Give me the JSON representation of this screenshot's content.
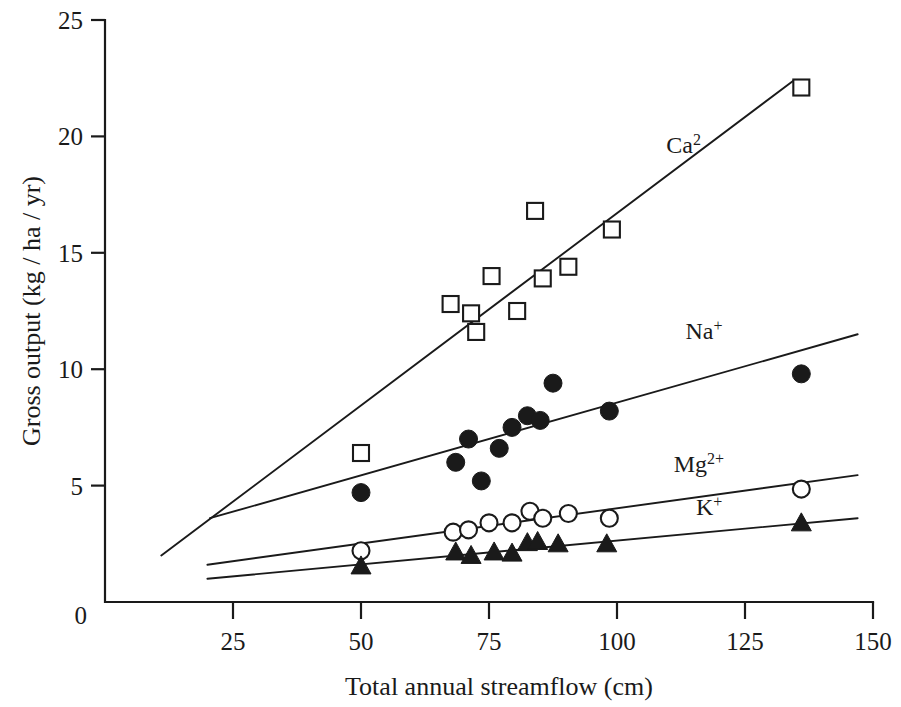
{
  "chart_data": {
    "type": "scatter",
    "title": "",
    "xlabel": "Total annual streamflow (cm)",
    "ylabel": "Gross output (kg / ha / yr)",
    "xlim": [
      0,
      150
    ],
    "ylim": [
      0,
      25
    ],
    "xticks": [
      0,
      25,
      50,
      75,
      100,
      125,
      150
    ],
    "xticklabels": [
      "0",
      "25",
      "50",
      "75",
      "100",
      "125",
      "150"
    ],
    "yticks": [
      0,
      5,
      10,
      15,
      20,
      25
    ],
    "yticklabels": [
      "0",
      "5",
      "10",
      "15",
      "20",
      "25"
    ],
    "grid": false,
    "legend_position": "inline-right-of-lines",
    "series": [
      {
        "name": "Ca2",
        "label_html": "Ca<sup>2</sup>",
        "label_text": "Ca2",
        "marker": "open-square",
        "label_x": 113,
        "label_y": 19.3,
        "points": [
          {
            "x": 50.0,
            "y": 6.4
          },
          {
            "x": 67.5,
            "y": 12.8
          },
          {
            "x": 71.5,
            "y": 12.4
          },
          {
            "x": 72.5,
            "y": 11.6
          },
          {
            "x": 75.5,
            "y": 14.0
          },
          {
            "x": 80.5,
            "y": 12.5
          },
          {
            "x": 84.0,
            "y": 16.8
          },
          {
            "x": 85.5,
            "y": 13.9
          },
          {
            "x": 90.5,
            "y": 14.4
          },
          {
            "x": 99.0,
            "y": 16.0
          },
          {
            "x": 136.0,
            "y": 22.1
          }
        ],
        "fit": {
          "x1": 11.0,
          "y1": 2.0,
          "x2": 134.5,
          "y2": 22.4
        }
      },
      {
        "name": "Na+",
        "label_html": "Na<sup>+</sup>",
        "label_text": "Na+",
        "marker": "filled-circle",
        "label_x": 117,
        "label_y": 11.3,
        "points": [
          {
            "x": 50.0,
            "y": 4.7
          },
          {
            "x": 68.5,
            "y": 6.0
          },
          {
            "x": 71.0,
            "y": 7.0
          },
          {
            "x": 73.5,
            "y": 5.2
          },
          {
            "x": 77.0,
            "y": 6.6
          },
          {
            "x": 79.5,
            "y": 7.5
          },
          {
            "x": 82.5,
            "y": 8.0
          },
          {
            "x": 85.0,
            "y": 7.8
          },
          {
            "x": 87.5,
            "y": 9.4
          },
          {
            "x": 98.5,
            "y": 8.2
          },
          {
            "x": 136.0,
            "y": 9.8
          }
        ],
        "fit": {
          "x1": 20.5,
          "y1": 3.6,
          "x2": 147.0,
          "y2": 11.5
        }
      },
      {
        "name": "Mg2+",
        "label_html": "Mg<sup>2+</sup>",
        "label_text": "Mg2+",
        "marker": "open-circle",
        "label_x": 116,
        "label_y": 5.6,
        "points": [
          {
            "x": 50.0,
            "y": 2.2
          },
          {
            "x": 68.0,
            "y": 3.0
          },
          {
            "x": 71.0,
            "y": 3.1
          },
          {
            "x": 75.0,
            "y": 3.4
          },
          {
            "x": 79.5,
            "y": 3.4
          },
          {
            "x": 83.0,
            "y": 3.9
          },
          {
            "x": 85.5,
            "y": 3.6
          },
          {
            "x": 90.5,
            "y": 3.8
          },
          {
            "x": 98.5,
            "y": 3.6
          },
          {
            "x": 136.0,
            "y": 4.85
          }
        ],
        "fit": {
          "x1": 20.0,
          "y1": 1.6,
          "x2": 147.0,
          "y2": 5.45
        }
      },
      {
        "name": "K+",
        "label_html": "K<sup>+</sup>",
        "label_text": "K+",
        "marker": "filled-triangle",
        "label_x": 118,
        "label_y": 3.75,
        "points": [
          {
            "x": 50.0,
            "y": 1.5
          },
          {
            "x": 68.5,
            "y": 2.1
          },
          {
            "x": 71.5,
            "y": 1.95
          },
          {
            "x": 76.0,
            "y": 2.1
          },
          {
            "x": 79.5,
            "y": 2.05
          },
          {
            "x": 82.5,
            "y": 2.5
          },
          {
            "x": 84.5,
            "y": 2.55
          },
          {
            "x": 88.5,
            "y": 2.45
          },
          {
            "x": 98.0,
            "y": 2.45
          },
          {
            "x": 136.0,
            "y": 3.35
          }
        ],
        "fit": {
          "x1": 20.0,
          "y1": 1.0,
          "x2": 147.0,
          "y2": 3.6
        }
      }
    ]
  }
}
